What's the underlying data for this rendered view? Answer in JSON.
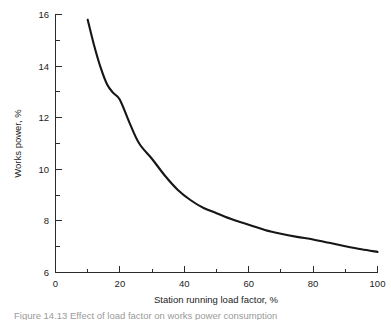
{
  "figure": {
    "caption": "Figure 14.13 Effect of load factor on works power consumption",
    "background_color": "#ffffff",
    "line_color": "#161616",
    "axis_color": "#2b2b2b"
  },
  "chart_data": {
    "type": "line",
    "title": "",
    "subtitle": "",
    "xlabel": "Station running load factor, %",
    "ylabel": "Works power, %",
    "xlim": [
      0,
      100
    ],
    "ylim": [
      6,
      16
    ],
    "grid": false,
    "legend": null,
    "x_ticks_major": [
      0,
      20,
      40,
      60,
      80,
      100
    ],
    "x_ticks_minor": [
      10,
      30,
      50,
      70,
      90
    ],
    "y_ticks_major": [
      6,
      8,
      10,
      12,
      14,
      16
    ],
    "y_ticks_minor": [
      7,
      9,
      11,
      13,
      15
    ],
    "x_tick_labels": [
      "0",
      "20",
      "40",
      "60",
      "80",
      "100"
    ],
    "y_tick_labels": [
      "6",
      "8",
      "10",
      "12",
      "14",
      "16"
    ],
    "series": [
      {
        "name": "Works power",
        "x": [
          10,
          12,
          14,
          16,
          18,
          20,
          23,
          26,
          30,
          34,
          38,
          42,
          46,
          50,
          55,
          60,
          65,
          70,
          75,
          80,
          85,
          90,
          95,
          100
        ],
        "y": [
          15.8,
          14.8,
          13.95,
          13.3,
          12.95,
          12.7,
          11.8,
          11.0,
          10.4,
          9.75,
          9.2,
          8.8,
          8.5,
          8.3,
          8.05,
          7.85,
          7.65,
          7.5,
          7.38,
          7.28,
          7.15,
          7.02,
          6.9,
          6.8
        ]
      }
    ]
  }
}
